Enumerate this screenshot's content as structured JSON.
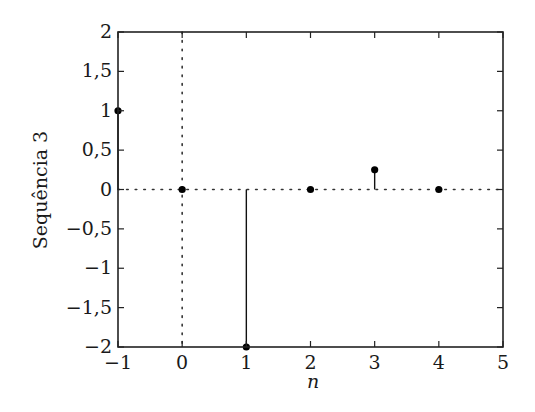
{
  "chart_data": {
    "type": "stem",
    "title": "",
    "xlabel": "n",
    "ylabel": "Sequência 3",
    "x": [
      -1,
      0,
      1,
      2,
      3,
      4
    ],
    "values": [
      1,
      0,
      -2,
      0,
      0.25,
      0
    ],
    "xlim": [
      -1,
      5
    ],
    "ylim": [
      -2,
      2
    ],
    "xticks": [
      -1,
      0,
      1,
      2,
      3,
      4,
      5
    ],
    "xtick_labels": [
      "−1",
      "0",
      "1",
      "2",
      "3",
      "4",
      "5"
    ],
    "yticks": [
      -2,
      -1.5,
      -1,
      -0.5,
      0,
      0.5,
      1,
      1.5,
      2
    ],
    "ytick_labels": [
      "−2",
      "−1,5",
      "−1",
      "−0,5",
      "0",
      "0,5",
      "1",
      "1,5",
      "2"
    ],
    "grid": false,
    "reference_lines": [
      {
        "orientation": "horizontal",
        "value": 0,
        "style": "dotted"
      },
      {
        "orientation": "vertical",
        "value": 0,
        "style": "dotted"
      }
    ],
    "legend": null,
    "colors": {
      "stem": "#111111",
      "marker": "#000000",
      "axes": "#222222"
    }
  }
}
